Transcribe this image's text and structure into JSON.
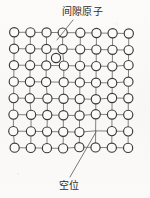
{
  "figure": {
    "name": "crystal-lattice-point-defects",
    "background_color": "#fbfaf8",
    "atom_stroke_color": "#3a3836",
    "bond_color": "#6e6b67",
    "leader_color": "#5b5855",
    "text_color": "#2e2c2a",
    "grid": {
      "rows": 8,
      "cols": 8,
      "origin_x": 14,
      "origin_y": 33,
      "step_x": 16.4,
      "step_y": 16.4,
      "atom_radius": 4.6,
      "atom_stroke_width": 1.15,
      "bond_stroke_width": 0.85
    },
    "vacancy": {
      "row": 6,
      "col": 5,
      "label": "空位",
      "leader_from_x": 70,
      "leader_from_y": 177,
      "leader_to_x": 96,
      "leader_to_y": 132
    },
    "interstitial": {
      "label": "间隙原子",
      "atom_x": 56,
      "atom_y": 58,
      "atom_radius": 4.6,
      "leader_from_x": 73,
      "leader_from_y": 20,
      "leader_to_x": 57,
      "leader_to_y": 40
    }
  },
  "chart_data": {
    "type": "diagram",
    "title": "",
    "subtitle": "",
    "xlabel": "",
    "ylabel": "",
    "annotations": [
      {
        "label": "间隙原子",
        "meaning": "interstitial atom",
        "position": "top",
        "points_to": "extra atom between lattice sites near row 2, col 3"
      },
      {
        "label": "空位",
        "meaning": "vacancy",
        "position": "bottom",
        "points_to": "missing atom at lattice row 7, col 6"
      }
    ],
    "lattice": {
      "rows": 8,
      "cols": 8,
      "total_sites": 64,
      "atoms_drawn": 64,
      "vacancies": 1,
      "interstitials": 1,
      "vacancy_site": {
        "row": 7,
        "col": 6
      }
    },
    "legend_position": "none",
    "grid": false
  }
}
